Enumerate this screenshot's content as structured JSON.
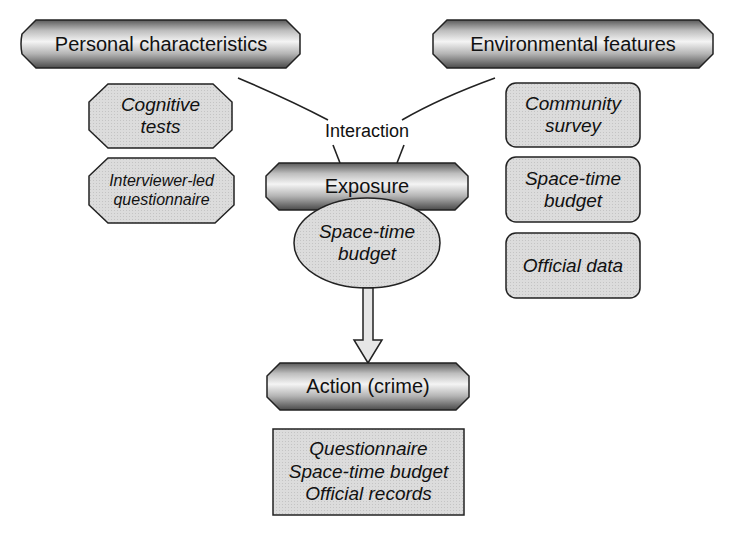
{
  "diagram": {
    "nodes": {
      "personal": {
        "label": "Personal characteristics",
        "shape": "rounded-octagon-banner"
      },
      "environmental": {
        "label": "Environmental features",
        "shape": "rounded-octagon-banner"
      },
      "cognitive_tests": {
        "label": "Cognitive\ntests",
        "line1": "Cognitive",
        "line2": "tests",
        "shape": "octagon"
      },
      "interviewer_questionnaire": {
        "label": "Interviewer-led\nquestionnaire",
        "line1": "Interviewer-led",
        "line2": "questionnaire",
        "shape": "octagon"
      },
      "interaction": {
        "label": "Interaction",
        "shape": "text"
      },
      "exposure": {
        "label": "Exposure",
        "shape": "rounded-octagon-banner"
      },
      "space_time_budget_center": {
        "label": "Space-time\nbudget",
        "line1": "Space-time",
        "line2": "budget",
        "shape": "ellipse"
      },
      "action": {
        "label": "Action (crime)",
        "shape": "rounded-octagon-banner"
      },
      "action_measures": {
        "lines": [
          "Questionnaire",
          "Space-time budget",
          "Official records"
        ],
        "shape": "rectangle"
      },
      "community_survey": {
        "label": "Community\nsurvey",
        "line1": "Community",
        "line2": "survey",
        "shape": "rounded-rectangle"
      },
      "space_time_budget_env": {
        "label": "Space-time\nbudget",
        "line1": "Space-time",
        "line2": "budget",
        "shape": "rounded-rectangle"
      },
      "official_data": {
        "label": "Official data",
        "shape": "rounded-rectangle"
      }
    },
    "edges": [
      {
        "from": "personal",
        "to": "interaction",
        "type": "line"
      },
      {
        "from": "environmental",
        "to": "interaction",
        "type": "line"
      },
      {
        "from": "interaction",
        "to": "exposure",
        "type": "double-line"
      },
      {
        "from": "exposure",
        "to": "space_time_budget_center",
        "type": "double-line"
      },
      {
        "from": "space_time_budget_center",
        "to": "action",
        "type": "block-arrow"
      }
    ],
    "colors": {
      "fill_light": "#d9d9d9",
      "banner_dark": "#555555",
      "banner_light": "#f2f2f2",
      "stroke": "#222222"
    }
  }
}
